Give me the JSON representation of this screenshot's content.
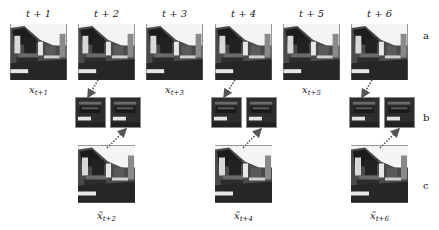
{
  "row_labels": [
    "a",
    "b",
    "c"
  ],
  "time_labels": [
    "t + 1",
    "t + 2",
    "t + 3",
    "t + 4",
    "t + 5",
    "t + 6"
  ],
  "row_a": {
    "frames": [
      "frame t+1",
      "frame t+2",
      "frame t+3",
      "frame t+4",
      "frame t+5",
      "frame t+6"
    ],
    "input_labels": [
      {
        "base": "x",
        "sub": "t+1"
      },
      {
        "base": "x",
        "sub": "t+3"
      },
      {
        "base": "x",
        "sub": "t+5"
      }
    ]
  },
  "row_b": {
    "patch_pairs": 3
  },
  "row_c": {
    "output_labels": [
      {
        "base": "x̃",
        "sub": "t+2"
      },
      {
        "base": "x̃",
        "sub": "t+4"
      },
      {
        "base": "x̃",
        "sub": "t+6"
      }
    ]
  },
  "colors": {
    "arrow": "#555555",
    "frame_dark": "#2a2a2a",
    "sky": "#f2f2f2"
  }
}
